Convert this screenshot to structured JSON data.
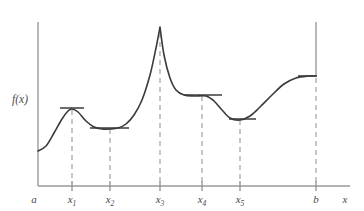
{
  "figure": {
    "y_axis_label": "f(x)",
    "x_axis_label": "x"
  },
  "axis": {
    "left_endpoint_label": "a",
    "right_endpoint_label": "b",
    "x_axis_name": "x",
    "axis_color": "#9a9a9a",
    "curve_color": "#3b3b3b",
    "dash_color": "#a9a9a9"
  },
  "tick_labels": [
    {
      "base": "x",
      "sub": "1",
      "x": 72
    },
    {
      "base": "x",
      "sub": "2",
      "x": 110
    },
    {
      "base": "x",
      "sub": "3",
      "x": 160
    },
    {
      "base": "x",
      "sub": "4",
      "x": 202
    },
    {
      "base": "x",
      "sub": "5",
      "x": 240
    }
  ],
  "chart_data": {
    "type": "line",
    "xlabel": "x",
    "ylabel": "f(x)",
    "grid": false,
    "legend": null,
    "xlim": [
      38,
      316
    ],
    "ylim": [
      186,
      20
    ],
    "x_tick_labels": [
      "a",
      "x1",
      "x2",
      "x3",
      "x4",
      "x5",
      "b"
    ],
    "x_tick_positions": [
      38,
      72,
      110,
      160,
      202,
      240,
      316
    ],
    "critical_points": [
      {
        "label": "x1",
        "x": 72,
        "y": 110,
        "kind": "local maximum",
        "horizontal_tangent": true
      },
      {
        "label": "x2",
        "x": 110,
        "y": 129,
        "kind": "local minimum",
        "horizontal_tangent": true
      },
      {
        "label": "x3",
        "x": 160,
        "y": 27,
        "kind": "absolute maximum (corner / cusp)",
        "horizontal_tangent": false
      },
      {
        "label": "x4",
        "x": 202,
        "y": 96,
        "kind": "flat plateau / stationary point",
        "horizontal_tangent": true
      },
      {
        "label": "x5",
        "x": 240,
        "y": 120,
        "kind": "local minimum",
        "horizontal_tangent": true
      }
    ],
    "tangent_segments": [
      {
        "at": "x1",
        "x_start": 60,
        "x_end": 84,
        "y": 108
      },
      {
        "at": "x2",
        "x_start": 90,
        "x_end": 129,
        "y": 128
      },
      {
        "at": "x4",
        "x_start": 184,
        "x_end": 222,
        "y": 95
      },
      {
        "at": "x5",
        "x_start": 229,
        "x_end": 256,
        "y": 119
      },
      {
        "at": "b",
        "x_start": 298,
        "x_end": 317,
        "y": 76
      }
    ],
    "curve_points": [
      {
        "x": 38,
        "y": 151
      },
      {
        "x": 46,
        "y": 146
      },
      {
        "x": 54,
        "y": 133
      },
      {
        "x": 62,
        "y": 119
      },
      {
        "x": 68,
        "y": 111
      },
      {
        "x": 72,
        "y": 109
      },
      {
        "x": 78,
        "y": 112
      },
      {
        "x": 86,
        "y": 121
      },
      {
        "x": 94,
        "y": 127
      },
      {
        "x": 102,
        "y": 129
      },
      {
        "x": 110,
        "y": 129
      },
      {
        "x": 118,
        "y": 128
      },
      {
        "x": 126,
        "y": 124
      },
      {
        "x": 134,
        "y": 115
      },
      {
        "x": 142,
        "y": 100
      },
      {
        "x": 150,
        "y": 75
      },
      {
        "x": 156,
        "y": 48
      },
      {
        "x": 160,
        "y": 27
      },
      {
        "x": 164,
        "y": 55
      },
      {
        "x": 170,
        "y": 78
      },
      {
        "x": 176,
        "y": 90
      },
      {
        "x": 184,
        "y": 95
      },
      {
        "x": 194,
        "y": 96
      },
      {
        "x": 206,
        "y": 96
      },
      {
        "x": 214,
        "y": 101
      },
      {
        "x": 222,
        "y": 110
      },
      {
        "x": 230,
        "y": 118
      },
      {
        "x": 240,
        "y": 120
      },
      {
        "x": 250,
        "y": 116
      },
      {
        "x": 260,
        "y": 107
      },
      {
        "x": 272,
        "y": 95
      },
      {
        "x": 284,
        "y": 84
      },
      {
        "x": 296,
        "y": 78
      },
      {
        "x": 308,
        "y": 76
      },
      {
        "x": 316,
        "y": 76
      }
    ]
  }
}
